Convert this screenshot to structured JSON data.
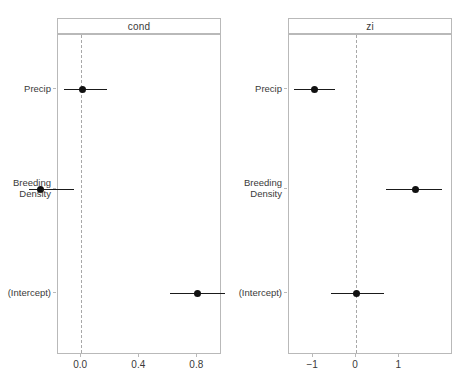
{
  "figure": {
    "kind": "coefficient-forest-plot",
    "background": "#ffffff",
    "point_color": "#111111",
    "line_color": "#1a1a1a",
    "border_color": "#b9b9b9",
    "zero_line_color": "#a8a8a8",
    "cropped_title_fragment": ""
  },
  "panels": [
    {
      "id": "cond",
      "strip_label": "cond",
      "x_ticks": [
        "0.0",
        "0.4",
        "0.8"
      ],
      "x_tick_values": [
        0.0,
        0.4,
        0.8
      ],
      "x_zero_value": 0.0
    },
    {
      "id": "zi",
      "strip_label": "zi",
      "x_ticks": [
        "−1",
        "0",
        "1"
      ],
      "x_tick_values": [
        -1,
        0,
        1
      ],
      "x_zero_value": 0.0
    }
  ],
  "terms": [
    "Precip",
    "Breeding\nDensity",
    "(Intercept)"
  ],
  "chart_data": {
    "type": "scatter",
    "title": "",
    "xlabel": "",
    "ylabel": "",
    "grid": false,
    "legend": "none",
    "facets": [
      "cond",
      "zi"
    ],
    "categories": [
      "Precip",
      "Breeding Density",
      "(Intercept)"
    ],
    "series": [
      {
        "name": "cond",
        "xlim": [
          -0.16,
          0.97
        ],
        "xticks": [
          0.0,
          0.4,
          0.8
        ],
        "points": [
          {
            "term": "Precip",
            "estimate": 0.01,
            "ci_low": -0.12,
            "ci_high": 0.18
          },
          {
            "term": "Breeding Density",
            "estimate": -0.28,
            "ci_low": -0.36,
            "ci_high": -0.05
          },
          {
            "term": "(Intercept)",
            "estimate": 0.8,
            "ci_low": 0.61,
            "ci_high": 0.99
          }
        ]
      },
      {
        "name": "zi",
        "xlim": [
          -1.56,
          2.25
        ],
        "xticks": [
          -1,
          0,
          1
        ],
        "points": [
          {
            "term": "Precip",
            "estimate": -0.98,
            "ci_low": -1.44,
            "ci_high": -0.49
          },
          {
            "term": "Breeding Density",
            "estimate": 1.37,
            "ci_low": 0.7,
            "ci_high": 2.0
          },
          {
            "term": "(Intercept)",
            "estimate": 0.0,
            "ci_low": -0.58,
            "ci_high": 0.65
          }
        ]
      }
    ]
  }
}
